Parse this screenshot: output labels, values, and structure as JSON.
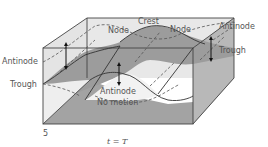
{
  "figure": {
    "labels": {
      "node_left": "Node",
      "crest": "Crest",
      "node_right": "Node",
      "antinode_right": "Antinode",
      "trough_right": "Trough",
      "antinode_left": "Antinode",
      "trough_left": "Trough",
      "antinode_center": "Antinode",
      "no_motion": "No motion",
      "panel_number": "5",
      "caption": "t = T"
    },
    "colors": {
      "box_face_light": "#e6e6e6",
      "surface_dark": "#9a9a9a",
      "surface_mid": "#b4b4b4",
      "edges": "#444444",
      "text": "#555555"
    }
  }
}
